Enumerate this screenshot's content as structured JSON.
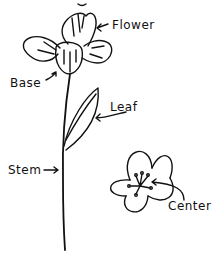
{
  "diagram": {
    "stroke_color": "#111111",
    "labels": {
      "flower": "Flower",
      "base": "Base",
      "leaf": "Leaf",
      "stem": "Stem",
      "center": "Center"
    }
  }
}
